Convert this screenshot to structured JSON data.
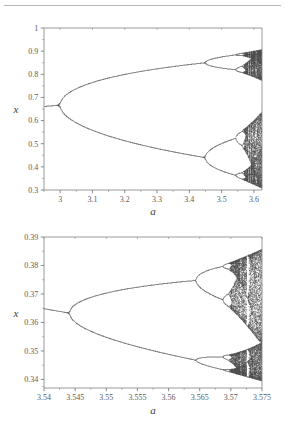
{
  "page": {
    "background_color": "#ffffff",
    "divider_color": "#b6b6b6",
    "text_color": "#4a4a4a",
    "data_color": "#141414",
    "axis_color": "#808080"
  },
  "chart_data": [
    {
      "id": "bifurcation-overview",
      "type": "scatter",
      "title": "",
      "subtitle": "",
      "xlabel": "a",
      "ylabel": "x",
      "xlim": [
        2.95,
        3.625
      ],
      "ylim": [
        0.3,
        1.0
      ],
      "grid": false,
      "legend": null,
      "x_ticks": [
        3,
        3.1,
        3.2,
        3.3,
        3.4,
        3.5,
        3.6
      ],
      "x_tick_labels": [
        "3",
        "3.1",
        "3.2",
        "3.3",
        "3.4",
        "3.5",
        "3.6"
      ],
      "x_minor_ticks": [
        2.95,
        3.05,
        3.15,
        3.25,
        3.35,
        3.45,
        3.55
      ],
      "y_ticks": [
        0.3,
        0.4,
        0.5,
        0.6,
        0.7,
        0.8,
        0.9,
        1.0
      ],
      "y_tick_labels": [
        "0.3",
        "0.4",
        "0.5",
        "0.6",
        "0.7",
        "0.8",
        "0.9",
        "1"
      ],
      "y_minor_ticks": [
        0.35,
        0.45,
        0.55,
        0.65,
        0.75,
        0.85,
        0.95
      ],
      "map": {
        "name": "logistic-map",
        "equation": "x_{n+1} = a * x_n * (1 - x_n)",
        "x0": 0.35,
        "transient_iterations": 300,
        "plotted_iterations": 190,
        "a_samples": 760
      },
      "features": {
        "period_1_branch": "x = 1 - 1/a for a < 3",
        "first_bifurcation_a": 3.0,
        "first_bifurcation_x": 0.6667,
        "second_bifurcation_a": 3.449,
        "third_bifurcation_a": 3.544,
        "fourth_bifurcation_a": 3.564,
        "chaos_onset_a": 3.5699,
        "upper_branch_at_3.449": 0.8499,
        "lower_branch_at_3.449": 0.44
      }
    },
    {
      "id": "bifurcation-zoom",
      "type": "scatter",
      "title": "",
      "subtitle": "",
      "xlabel": "a",
      "ylabel": "x",
      "xlim": [
        3.54,
        3.575
      ],
      "ylim": [
        0.337,
        0.39
      ],
      "grid": false,
      "legend": null,
      "x_ticks": [
        3.54,
        3.545,
        3.55,
        3.555,
        3.56,
        3.565,
        3.57,
        3.575
      ],
      "x_tick_labels": [
        "3.54",
        "3.545",
        "3.55",
        "3.555",
        "3.56",
        "3.565",
        "3.57",
        "3.575"
      ],
      "x_minor_ticks": [
        3.5425,
        3.5475,
        3.5525,
        3.5575,
        3.5625,
        3.5675,
        3.5725
      ],
      "y_ticks": [
        0.34,
        0.35,
        0.36,
        0.37,
        0.38,
        0.39
      ],
      "y_tick_labels": [
        "0.34",
        "0.35",
        "0.36",
        "0.37",
        "0.38",
        "0.39"
      ],
      "y_minor_ticks": [
        0.3375,
        0.345,
        0.355,
        0.365,
        0.375,
        0.385
      ],
      "map": {
        "name": "logistic-map",
        "equation": "x_{n+1} = a * x_n * (1 - x_n)",
        "x0": 0.35,
        "transient_iterations": 1200,
        "plotted_iterations": 420,
        "a_samples": 820
      },
      "features": {
        "branch_start_x": 0.3648,
        "bifurcation_a": 3.5441,
        "second_bifurcation_a": 3.5644,
        "third_bifurcation_a": 3.5688,
        "chaos_onset_a": 3.5699,
        "upper_branch_at_3.5644": 0.3749,
        "lower_branch_at_3.5644": 0.3476
      }
    }
  ]
}
